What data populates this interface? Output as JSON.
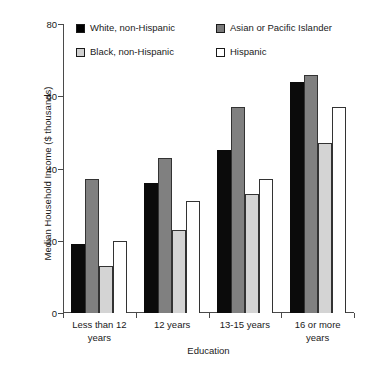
{
  "chart_data": {
    "type": "bar",
    "title": "",
    "xlabel": "Education",
    "ylabel": "Median Household Income ($ thousands)",
    "categories": [
      "Less than 12 years",
      "12 years",
      "13-15 years",
      "16 or more years"
    ],
    "series": [
      {
        "name": "White, non-Hispanic",
        "swatch": "black",
        "color": "#0b0b0b",
        "values": [
          19,
          36,
          45,
          64
        ]
      },
      {
        "name": "Asian or Pacific Islander",
        "swatch": "dark-gray",
        "color": "#808080",
        "values": [
          37,
          43,
          57,
          66
        ]
      },
      {
        "name": "Black, non-Hispanic",
        "swatch": "light-gray",
        "color": "#d4d4d4",
        "values": [
          13,
          23,
          33,
          47
        ]
      },
      {
        "name": "Hispanic",
        "swatch": "white",
        "color": "#ffffff",
        "values": [
          20,
          31,
          37,
          57
        ]
      }
    ],
    "ylim": [
      0,
      80
    ],
    "yticks": [
      0,
      20,
      40,
      60,
      80
    ],
    "ytick_labels": [
      "0",
      "20",
      "40",
      "60",
      "80"
    ],
    "grid": false,
    "legend_position": "top"
  },
  "legend": {
    "items": [
      {
        "label": "White, non-Hispanic"
      },
      {
        "label": "Asian or Pacific Islander"
      },
      {
        "label": "Black, non-Hispanic"
      },
      {
        "label": "Hispanic"
      }
    ]
  },
  "axes": {
    "y_title": "Median Household Income ($ thousands)",
    "x_title": "Education",
    "y_tick_labels": [
      "80",
      "60",
      "40",
      "20",
      "0"
    ],
    "x_tick_labels": [
      {
        "line1": "Less than 12",
        "line2": "years"
      },
      {
        "line1": "12 years",
        "line2": ""
      },
      {
        "line1": "13-15 years",
        "line2": ""
      },
      {
        "line1": "16 or more",
        "line2": "years"
      }
    ]
  }
}
